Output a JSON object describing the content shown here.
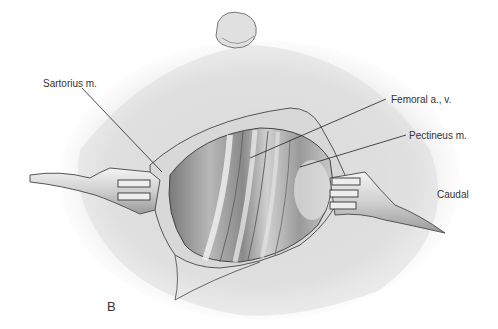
{
  "figure": {
    "panel_letter": "B",
    "labels": {
      "sartorius": "Sartorius m.",
      "femoral": "Femoral a., v.",
      "pectineus": "Pectineus m.",
      "orientation": "Caudal"
    }
  }
}
